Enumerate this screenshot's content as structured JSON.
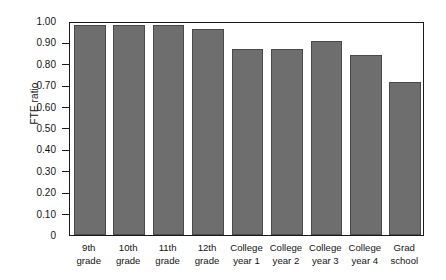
{
  "chart_data": {
    "type": "bar",
    "title": "",
    "xlabel": "",
    "ylabel": "FTE ratio",
    "ylim": [
      0,
      1.0
    ],
    "grid": false,
    "legend": "none",
    "bar_color": "#6e6e6e",
    "bar_edge_color": "#4a4a4a",
    "background": "#ffffff",
    "axis_color": "#1a1a1a",
    "ytick_labels": [
      "1.00",
      "0.90",
      "0.80",
      "0.70",
      "0.60",
      "0.50",
      "0.40",
      "0.30",
      "0.20",
      "0.10",
      "0"
    ],
    "ytick_values": [
      1.0,
      0.9,
      0.8,
      0.7,
      0.6,
      0.5,
      0.4,
      0.3,
      0.2,
      0.1,
      0
    ],
    "categories": [
      "9th grade",
      "10th grade",
      "11th grade",
      "12th grade",
      "College year 1",
      "College year 2",
      "College year 3",
      "College year 4",
      "Grad school"
    ],
    "category_lines": [
      [
        "9th",
        "grade"
      ],
      [
        "10th",
        "grade"
      ],
      [
        "11th",
        "grade"
      ],
      [
        "12th",
        "grade"
      ],
      [
        "College",
        "year 1"
      ],
      [
        "College",
        "year 2"
      ],
      [
        "College",
        "year 3"
      ],
      [
        "College",
        "year 4"
      ],
      [
        "Grad",
        "school"
      ]
    ],
    "values": [
      0.98,
      0.98,
      0.98,
      0.965,
      0.87,
      0.87,
      0.905,
      0.84,
      0.715
    ]
  }
}
